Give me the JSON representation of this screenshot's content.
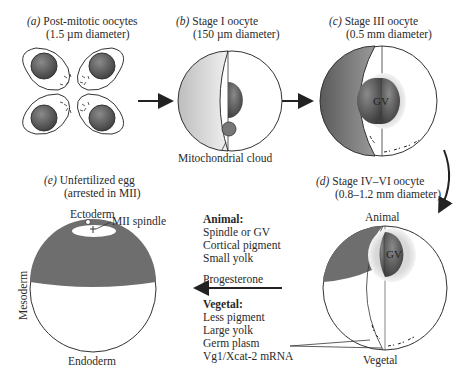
{
  "panels": {
    "a": {
      "letter": "(a)",
      "title": "Post-mitotic oocytes",
      "size": "(1.5 µm diameter)"
    },
    "b": {
      "letter": "(b)",
      "title": "Stage I oocyte",
      "size": "(150 µm diameter)",
      "callout": "Mitochondrial cloud"
    },
    "c": {
      "letter": "(c)",
      "title": "Stage III oocyte",
      "size": "(0.5 mm diameter)",
      "nucleus": "GV"
    },
    "d": {
      "letter": "(d)",
      "title": "Stage IV–VI oocyte",
      "size": "(0.8–1.2 mm diameter)",
      "nucleus": "GV",
      "top": "Animal",
      "bottom": "Vegetal"
    },
    "e": {
      "letter": "(e)",
      "title": "Unfertilized egg",
      "size": "(arrested in MII)",
      "top": "Ectoderm",
      "spindle": "MII spindle",
      "side": "Mesoderm",
      "bottom": "Endoderm"
    }
  },
  "legend": {
    "animal_heading": "Animal:",
    "animal_items": [
      "Spindle or GV",
      "Cortical pigment",
      "Small yolk"
    ],
    "arrow_label": "Progesterone",
    "vegetal_heading": "Vegetal:",
    "vegetal_items": [
      "Less pigment",
      "Large yolk",
      "Germ plasm",
      "Vg1/Xcat-2 mRNA"
    ]
  },
  "colors": {
    "pigment": "#6e6e6e",
    "nucleus": "#555555",
    "halo": "#cfcfcf",
    "outline": "#333333"
  }
}
